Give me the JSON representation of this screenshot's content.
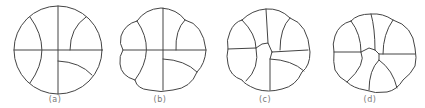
{
  "figure": {
    "panels": [
      {
        "id": "a",
        "label": "(a)"
      },
      {
        "id": "b",
        "label": "(b)"
      },
      {
        "id": "c",
        "label": "(c)"
      },
      {
        "id": "d",
        "label": "(d)"
      }
    ]
  },
  "colors": {
    "stroke": "#444444",
    "label": "#777777",
    "background": "#ffffff"
  }
}
